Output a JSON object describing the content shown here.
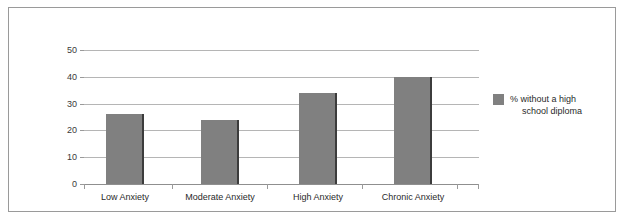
{
  "chart_data": {
    "type": "bar",
    "title": "",
    "subtitle": "",
    "xlabel": "",
    "ylabel": "",
    "categories": [
      "Low Anxiety",
      "Moderate Anxiety",
      "High Anxiety",
      "Chronic Anxiety"
    ],
    "series": [
      {
        "name": "% without a high school diploma",
        "values": [
          26,
          24,
          34,
          40
        ]
      }
    ],
    "values": [
      26,
      24,
      34,
      40
    ],
    "ylim": [
      0,
      50
    ],
    "ytick_labels": [
      "0",
      "10",
      "20",
      "30",
      "40",
      "50"
    ],
    "ytick_values": [
      0,
      10,
      20,
      30,
      40,
      50
    ],
    "grid": true,
    "legend_position": "right",
    "legend_entries": [
      {
        "label_line1": "% without a high",
        "label_line2": "school diploma",
        "color": "#808080"
      }
    ],
    "colors": {
      "bar_fill": "#808080",
      "bar_shadow": "#3c3c3c",
      "gridline": "#b5b5b5",
      "axis": "#8f8f8f",
      "frame": "#9a9a9a",
      "text": "#2a2a2a",
      "background": "#ffffff"
    }
  }
}
